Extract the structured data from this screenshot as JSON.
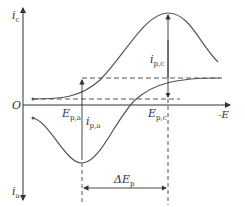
{
  "diagram": {
    "type": "cyclic-voltammogram",
    "axes": {
      "y_top_label": "i",
      "y_top_sub": "c",
      "y_bottom_label": "i",
      "y_bottom_sub": "a",
      "origin_label": "O",
      "x_label": "-E"
    },
    "annotations": {
      "ipc_label": "i",
      "ipc_sub": "p,c",
      "ipa_label": "i",
      "ipa_sub": "p,a",
      "epa_label": "E",
      "epa_sub": "p,a",
      "epc_label": "E",
      "epc_sub": "p,c",
      "delta_label": "ΔE",
      "delta_sub": "p"
    },
    "colors": {
      "curve": "#555555",
      "axis": "#333333",
      "dashed": "#444444"
    }
  }
}
